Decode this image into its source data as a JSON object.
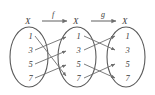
{
  "figure": {
    "type": "function-composition-arrow-diagram",
    "sets": [
      {
        "name": "X",
        "position": "left",
        "elements": [
          "1",
          "3",
          "5",
          "7"
        ]
      },
      {
        "name": "X",
        "position": "middle",
        "elements": [
          "1",
          "3",
          "5",
          "7"
        ]
      },
      {
        "name": "X",
        "position": "right",
        "elements": [
          "1",
          "3",
          "5",
          "7"
        ]
      }
    ],
    "maps": [
      {
        "label": "f",
        "from": "left",
        "to": "middle",
        "pairs": [
          {
            "from": "1",
            "to": "7"
          },
          {
            "from": "3",
            "to": "1"
          },
          {
            "from": "5",
            "to": "3"
          },
          {
            "from": "7",
            "to": "5"
          }
        ]
      },
      {
        "label": "g",
        "from": "middle",
        "to": "right",
        "pairs": [
          {
            "from": "1",
            "to": "3"
          },
          {
            "from": "3",
            "to": "1"
          },
          {
            "from": "5",
            "to": "7"
          },
          {
            "from": "7",
            "to": "5"
          }
        ]
      }
    ],
    "colors": {
      "ink": "#3c3c3c",
      "line": "#6e6e6e",
      "background": "#ffffff"
    }
  }
}
